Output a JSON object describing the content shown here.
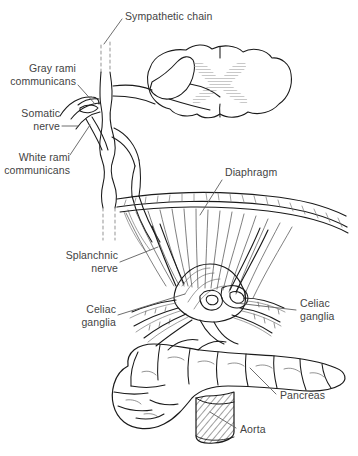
{
  "figure": {
    "type": "anatomical-line-diagram",
    "background_color": "#ffffff",
    "ink_color": "#1a1a1a",
    "label_color": "#434343",
    "gray_matter_color": "#a9a9a9"
  },
  "labels": {
    "sympathetic_chain": "Sympathetic chain",
    "gray_rami": "Gray rami\ncommunicans",
    "somatic_nerve": "Somatic\nnerve",
    "white_rami": "White rami\ncommunicans",
    "splanchnic_nerve": "Splanchnic\nnerve",
    "celiac_ganglia_left": "Celiac\nganglia",
    "celiac_ganglia_right": "Celiac\nganglia",
    "diaphragm": "Diaphragm",
    "pancreas": "Pancreas",
    "aorta": "Aorta"
  },
  "structures": [
    {
      "name": "spinal-cord",
      "description": "transverse section of spinal cord with butterfly-shaped gray matter"
    },
    {
      "name": "sympathetic-chain",
      "description": "paravertebral sympathetic trunk with ganglion"
    },
    {
      "name": "gray-rami-communicans",
      "description": "gray communicating branch to spinal nerve"
    },
    {
      "name": "white-rami-communicans",
      "description": "white communicating branch from spinal nerve"
    },
    {
      "name": "somatic-nerve",
      "description": "spinal nerve with dorsal and ventral roots"
    },
    {
      "name": "splanchnic-nerve",
      "description": "greater splanchnic nerve piercing the diaphragm"
    },
    {
      "name": "diaphragm",
      "description": "domed muscular sheet with radiating fibers and crura"
    },
    {
      "name": "celiac-ganglia",
      "description": "paired celiac ganglia and plexus around celiac trunk"
    },
    {
      "name": "pancreas",
      "description": "lobulated pancreas lying across the aorta"
    },
    {
      "name": "aorta",
      "description": "abdominal aorta shown in cut cross-hatched section"
    }
  ]
}
